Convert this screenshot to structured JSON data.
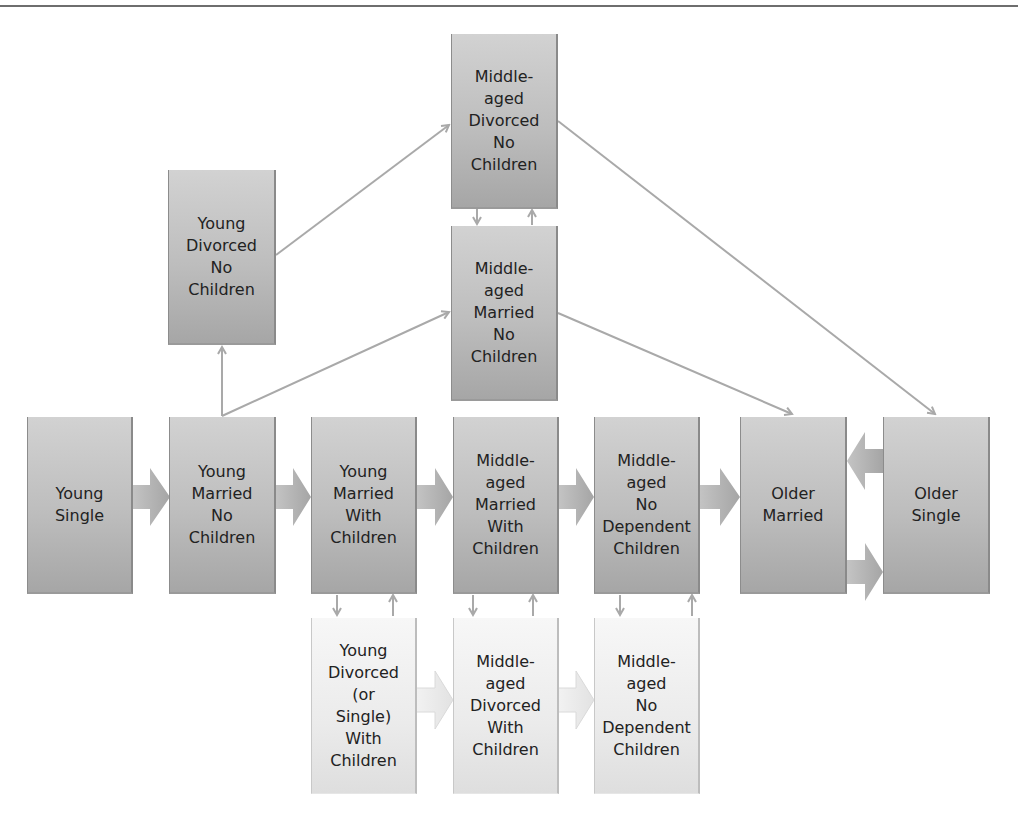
{
  "diagram": {
    "type": "family-life-cycle-flow",
    "colors": {
      "dark_box": "#bcbcbc",
      "light_box": "#eeeeee",
      "arrow": "#a9a9a9",
      "text": "#222222"
    },
    "nodes": {
      "young_single": {
        "label": "Young\nSingle"
      },
      "young_married_no_children": {
        "label": "Young\nMarried\nNo\nChildren"
      },
      "young_married_with_children": {
        "label": "Young\nMarried\nWith\nChildren"
      },
      "middle_aged_married_with_children": {
        "label": "Middle-\naged\nMarried\nWith\nChildren"
      },
      "middle_aged_no_dependent_children": {
        "label": "Middle-\naged\nNo\nDependent\nChildren"
      },
      "older_married": {
        "label": "Older\nMarried"
      },
      "older_single": {
        "label": "Older\nSingle"
      },
      "young_divorced_no_children": {
        "label": "Young\nDivorced\nNo\nChildren"
      },
      "middle_aged_divorced_no_children": {
        "label": "Middle-\naged\nDivorced\nNo\nChildren"
      },
      "middle_aged_married_no_children": {
        "label": "Middle-\naged\nMarried\nNo\nChildren"
      },
      "young_divorced_or_single_with_children": {
        "label": "Young\nDivorced\n(or\nSingle)\nWith\nChildren"
      },
      "middle_aged_divorced_with_children": {
        "label": "Middle-\naged\nDivorced\nWith\nChildren"
      },
      "middle_aged_no_dependent_children_alt": {
        "label": "Middle-\naged\nNo\nDependent\nChildren"
      }
    },
    "edges": [
      [
        "young_single",
        "young_married_no_children"
      ],
      [
        "young_married_no_children",
        "young_married_with_children"
      ],
      [
        "young_married_with_children",
        "middle_aged_married_with_children"
      ],
      [
        "middle_aged_married_with_children",
        "middle_aged_no_dependent_children"
      ],
      [
        "middle_aged_no_dependent_children",
        "older_married"
      ],
      [
        "older_married",
        "older_single"
      ],
      [
        "older_single",
        "older_married"
      ],
      [
        "young_married_no_children",
        "young_divorced_no_children"
      ],
      [
        "young_married_no_children",
        "middle_aged_married_no_children"
      ],
      [
        "young_divorced_no_children",
        "middle_aged_divorced_no_children"
      ],
      [
        "middle_aged_divorced_no_children",
        "middle_aged_married_no_children"
      ],
      [
        "middle_aged_married_no_children",
        "middle_aged_divorced_no_children"
      ],
      [
        "middle_aged_divorced_no_children",
        "older_single"
      ],
      [
        "middle_aged_married_no_children",
        "older_married"
      ],
      [
        "young_married_with_children",
        "young_divorced_or_single_with_children"
      ],
      [
        "young_divorced_or_single_with_children",
        "young_married_with_children"
      ],
      [
        "middle_aged_married_with_children",
        "middle_aged_divorced_with_children"
      ],
      [
        "middle_aged_divorced_with_children",
        "middle_aged_married_with_children"
      ],
      [
        "middle_aged_no_dependent_children",
        "middle_aged_no_dependent_children_alt"
      ],
      [
        "middle_aged_no_dependent_children_alt",
        "middle_aged_no_dependent_children"
      ],
      [
        "young_divorced_or_single_with_children",
        "middle_aged_divorced_with_children"
      ],
      [
        "middle_aged_divorced_with_children",
        "middle_aged_no_dependent_children_alt"
      ]
    ]
  }
}
